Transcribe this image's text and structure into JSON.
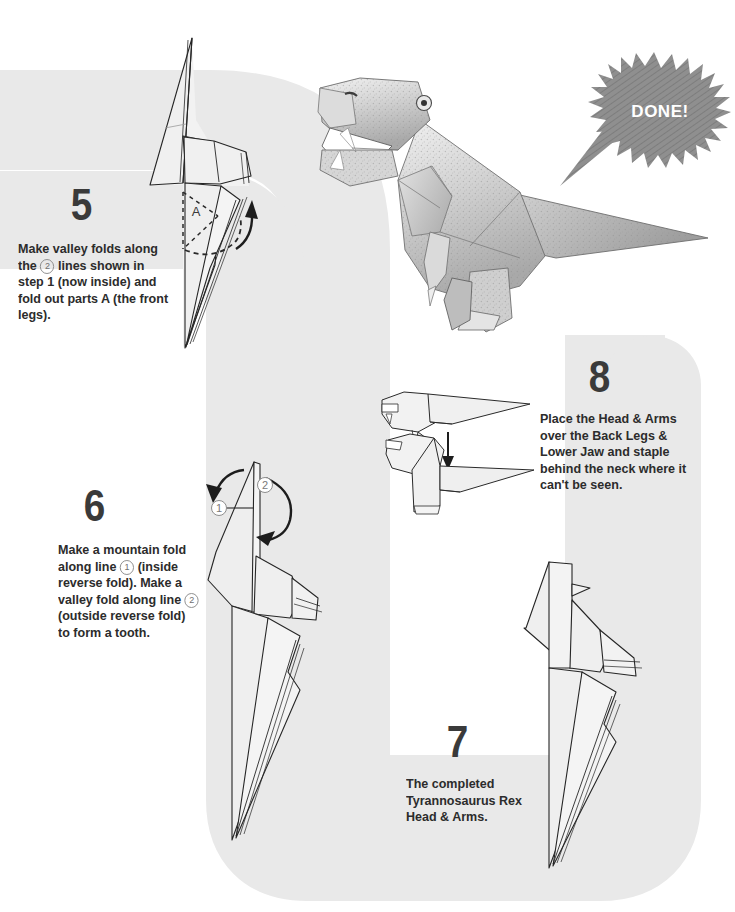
{
  "page": {
    "background_color": "#ffffff",
    "path_color": "#e9e9e9",
    "ink_color": "#2c2c2c"
  },
  "steps": [
    {
      "number": "5",
      "text_runs": [
        "Make valley folds along the ",
        "2",
        " lines shown in step 1 (now inside) and fold out parts A (the front legs)."
      ],
      "text": "Make valley folds along the 2 lines shown in step 1 (now inside) and fold out parts A (the front legs).",
      "diagram_label": "A"
    },
    {
      "number": "6",
      "text_runs": [
        "Make a mountain fold along line ",
        "1",
        " (inside reverse fold). Make a valley fold along line ",
        "2",
        " (outside reverse fold) to form a tooth."
      ],
      "text": "Make a mountain fold along line 1 (inside reverse fold). Make a valley fold along line 2 (outside reverse fold) to form a tooth.",
      "diagram_labels": [
        "1",
        "2"
      ]
    },
    {
      "number": "7",
      "text": "The completed Tyrannosaurus Rex Head & Arms."
    },
    {
      "number": "8",
      "text": "Place the Head & Arms over the Back Legs & Lower Jaw and staple behind the neck where it can't be seen."
    }
  ],
  "badge": {
    "label": "DONE!",
    "fill": "#8c8c8c",
    "text_color": "#ffffff"
  },
  "photo": {
    "caption": "Completed paper Tyrannosaurus Rex origami model"
  }
}
